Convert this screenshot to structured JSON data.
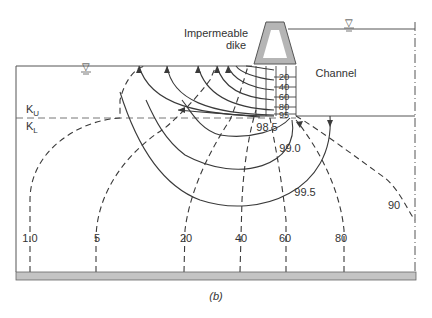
{
  "figure": {
    "caption": "(b)",
    "labels": {
      "dike": [
        "Impermeable",
        "dike"
      ],
      "channel": "Channel",
      "k_upper": "K",
      "k_upper_sub": "U",
      "k_lower": "K",
      "k_lower_sub": "L"
    },
    "water_table_symbol": "▽",
    "sheet_pile_percentages": [
      "20",
      "40",
      "60",
      "80",
      "95"
    ],
    "inner_contours": [
      "98.5",
      "99.0",
      "99.5"
    ],
    "outer_contour": "90",
    "bottom_contours": [
      "1.0",
      "5",
      "20",
      "40",
      "60",
      "80"
    ],
    "colors": {
      "line": "#3a3a3a",
      "dike_fill": "#b5b5b5",
      "base_fill": "#c4c4c4",
      "text": "#333333"
    }
  }
}
